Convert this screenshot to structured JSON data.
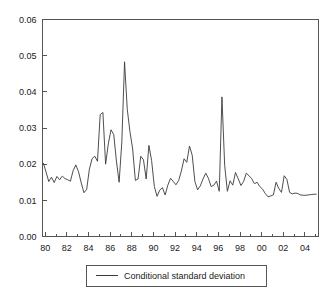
{
  "chart_data": {
    "type": "line",
    "title": "",
    "subtitle": "",
    "xlabel": "",
    "ylabel": "",
    "ylim": [
      0.0,
      0.06
    ],
    "xlim": [
      1979.75,
      2005.25
    ],
    "grid": false,
    "legend_position": "bottom-center",
    "y_tick_labels": [
      "0.00",
      "0.01",
      "0.02",
      "0.03",
      "0.04",
      "0.05",
      "0.06"
    ],
    "y_tick_values": [
      0.0,
      0.01,
      0.02,
      0.03,
      0.04,
      0.05,
      0.06
    ],
    "x_tick_labels": [
      "80",
      "82",
      "84",
      "86",
      "88",
      "90",
      "92",
      "94",
      "96",
      "98",
      "00",
      "02",
      "04"
    ],
    "x_tick_values": [
      1980,
      1982,
      1984,
      1986,
      1988,
      1990,
      1992,
      1994,
      1996,
      1998,
      2000,
      2002,
      2004
    ],
    "x_minor_tick_values": [
      1981,
      1983,
      1985,
      1987,
      1989,
      1991,
      1993,
      1995,
      1997,
      1999,
      2001,
      2003,
      2005
    ],
    "series": [
      {
        "name": "Conditional standard deviation",
        "color": "#3a3a3a",
        "x": [
          1979.83,
          1980.08,
          1980.33,
          1980.58,
          1980.83,
          1981.08,
          1981.33,
          1981.58,
          1981.83,
          1982.08,
          1982.33,
          1982.58,
          1982.83,
          1983.08,
          1983.33,
          1983.58,
          1983.83,
          1984.08,
          1984.33,
          1984.58,
          1984.83,
          1985.08,
          1985.33,
          1985.58,
          1985.83,
          1986.08,
          1986.33,
          1986.58,
          1986.83,
          1987.08,
          1987.33,
          1987.58,
          1987.83,
          1988.08,
          1988.33,
          1988.58,
          1988.83,
          1989.08,
          1989.33,
          1989.58,
          1989.83,
          1990.08,
          1990.33,
          1990.58,
          1990.83,
          1991.08,
          1991.33,
          1991.58,
          1991.83,
          1992.08,
          1992.33,
          1992.58,
          1992.83,
          1993.08,
          1993.33,
          1993.58,
          1993.83,
          1994.08,
          1994.33,
          1994.58,
          1994.83,
          1995.08,
          1995.33,
          1995.58,
          1995.83,
          1996.08,
          1996.33,
          1996.58,
          1996.83,
          1997.08,
          1997.33,
          1997.58,
          1997.83,
          1998.08,
          1998.33,
          1998.58,
          1998.83,
          1999.08,
          1999.33,
          1999.58,
          1999.83,
          2000.08,
          2000.33,
          2000.58,
          2000.83,
          2001.08,
          2001.33,
          2001.58,
          2001.83,
          2002.08,
          2002.33,
          2002.58,
          2002.83,
          2003.08,
          2003.33,
          2003.58,
          2003.83,
          2004.08,
          2004.33,
          2004.58,
          2004.83,
          2005.08
        ],
        "values": [
          0.0203,
          0.0178,
          0.0152,
          0.0164,
          0.0149,
          0.0166,
          0.0157,
          0.0167,
          0.016,
          0.0157,
          0.0153,
          0.0182,
          0.0198,
          0.0179,
          0.0148,
          0.0121,
          0.013,
          0.0186,
          0.0215,
          0.0222,
          0.0208,
          0.0337,
          0.0343,
          0.02,
          0.0256,
          0.0295,
          0.0282,
          0.0209,
          0.015,
          0.0262,
          0.0483,
          0.0352,
          0.029,
          0.0242,
          0.0155,
          0.0159,
          0.0222,
          0.0212,
          0.0159,
          0.0252,
          0.021,
          0.0139,
          0.0111,
          0.0128,
          0.0135,
          0.0115,
          0.0142,
          0.0161,
          0.0152,
          0.0143,
          0.0155,
          0.0181,
          0.0215,
          0.0205,
          0.025,
          0.0225,
          0.0152,
          0.0129,
          0.014,
          0.0159,
          0.0175,
          0.0161,
          0.0138,
          0.0142,
          0.0153,
          0.0125,
          0.0386,
          0.0197,
          0.0125,
          0.0154,
          0.0142,
          0.0177,
          0.016,
          0.0141,
          0.0152,
          0.0175,
          0.0168,
          0.016,
          0.0146,
          0.015,
          0.0138,
          0.0131,
          0.0119,
          0.011,
          0.0112,
          0.0115,
          0.015,
          0.0133,
          0.0122,
          0.0168,
          0.0158,
          0.0122,
          0.0118,
          0.012,
          0.0119,
          0.0115,
          0.0114,
          0.0114,
          0.0115,
          0.0116,
          0.0117,
          0.0117
        ]
      }
    ],
    "legend": [
      {
        "label": "Conditional standard deviation",
        "color": "#3a3a3a"
      }
    ]
  }
}
